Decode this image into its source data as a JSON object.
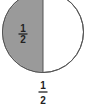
{
  "diagram": {
    "type": "fraction-circle",
    "colors": {
      "shaded": "#9a9a9a",
      "unshaded": "#ffffff",
      "outline": "#555555"
    },
    "shaded_part": {
      "numerator": "1",
      "denominator": "2"
    },
    "caption": {
      "numerator": "1",
      "denominator": "2"
    }
  }
}
